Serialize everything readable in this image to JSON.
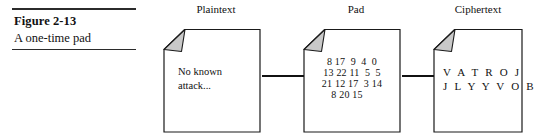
{
  "figure": {
    "number": "Figure 2-13",
    "title": "A one-time pad"
  },
  "diagram": {
    "type": "flow",
    "nodes": [
      {
        "id": "plaintext",
        "label": "Plaintext",
        "icon": "document-page-icon",
        "lines": [
          "No known",
          "attack..."
        ]
      },
      {
        "id": "pad",
        "label": "Pad",
        "icon": "document-page-icon",
        "lines": [
          "8 17  9  4  0",
          "13 22 11  5  5",
          "21 12 17  3 14",
          "8 20 15"
        ]
      },
      {
        "id": "ciphertext",
        "label": "Ciphertext",
        "icon": "document-page-icon",
        "lines": [
          "V A T R O J",
          "J L Y Y V O B"
        ]
      }
    ],
    "arrows": [
      {
        "id": "plaintext-to-pad",
        "from": "plaintext",
        "to": "pad",
        "direction": "right"
      },
      {
        "id": "pad-to-ciphertext",
        "from": "pad",
        "to": "ciphertext",
        "direction": "right"
      }
    ]
  },
  "colors": {
    "ink": "#111111",
    "rule": "#2b2b2b",
    "fold_fill": "#c9c9c9",
    "outline": "#1a1a1a"
  }
}
